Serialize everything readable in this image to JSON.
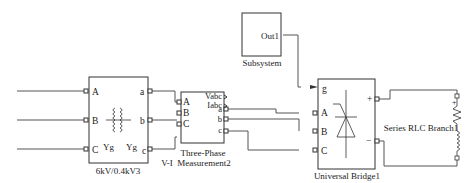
{
  "blocks": {
    "transformer": {
      "name": "6kV/0.4kV3",
      "ports_in": [
        "A",
        "B",
        "C"
      ],
      "ports_out": [
        "a",
        "b",
        "c"
      ],
      "winding_left": "Yg",
      "winding_right": "Yg"
    },
    "measurement": {
      "name_line1": "Three-Phase",
      "name_line2": "V-I  Measurement2",
      "ports_in": [
        "A",
        "B",
        "C"
      ],
      "signal_out": [
        "Vabc",
        "Iabc"
      ],
      "ports_out": [
        "a",
        "b",
        "c"
      ]
    },
    "subsystem": {
      "name": "Subsystem",
      "port_out": "Out1"
    },
    "bridge": {
      "name": "Universal Bridge1",
      "port_g": "g",
      "ports_in": [
        "A",
        "B",
        "C"
      ],
      "plus": "+",
      "minus": "−"
    },
    "rlc": {
      "name": "Series RLC Branch1",
      "plus": "+"
    }
  },
  "colors": {
    "line": "#555555",
    "text": "#222222"
  }
}
